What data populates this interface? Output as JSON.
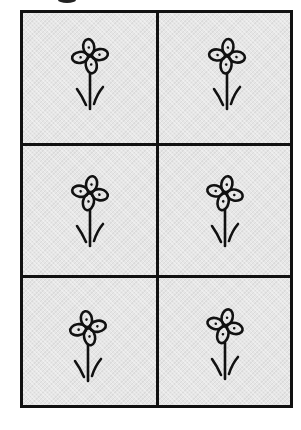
{
  "figure": {
    "type": "worksheet-grid",
    "rows": 3,
    "columns": 2,
    "cell_fill": "#e6e6e6",
    "line_color": "#111111",
    "cells": [
      {
        "row": 0,
        "col": 0,
        "icon": "flower-icon",
        "rotation": -8,
        "leaf_left": "left",
        "leaf_right": "right",
        "offset_x": 0,
        "offset_y": -4
      },
      {
        "row": 0,
        "col": 1,
        "icon": "flower-icon",
        "rotation": 6,
        "leaf_left": "left",
        "leaf_right": "right",
        "offset_x": 2,
        "offset_y": -4
      },
      {
        "row": 1,
        "col": 0,
        "icon": "flower-icon",
        "rotation": 10,
        "leaf_left": "left",
        "leaf_right": "right",
        "offset_x": 0,
        "offset_y": 0
      },
      {
        "row": 1,
        "col": 1,
        "icon": "flower-icon",
        "rotation": 12,
        "leaf_left": "left",
        "leaf_right": "right",
        "offset_x": 0,
        "offset_y": 0
      },
      {
        "row": 2,
        "col": 0,
        "icon": "flower-icon",
        "rotation": -10,
        "leaf_left": "left",
        "leaf_right": "right",
        "offset_x": -2,
        "offset_y": 4
      },
      {
        "row": 2,
        "col": 1,
        "icon": "flower-icon",
        "rotation": 14,
        "leaf_left": "left",
        "leaf_right": "right",
        "offset_x": 0,
        "offset_y": 2
      }
    ]
  }
}
